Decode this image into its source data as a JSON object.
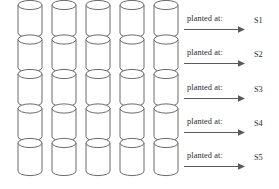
{
  "figure": {
    "type": "schematic-diagram",
    "background_color": "#ffffff",
    "stroke_color": "#5a5a5a",
    "fill_color": "#ffffff",
    "text_color": "#2b2b2b"
  },
  "grid": {
    "columns": 5,
    "rows": 5,
    "total_cylinders": 25,
    "cylinder": {
      "width": 24,
      "body_height": 28,
      "ellipse_ry": 4.6
    },
    "origin_x": 18,
    "origin_y": 5,
    "col_spacing": 34,
    "row_spacing": 34.5
  },
  "rows": [
    {
      "caption": "planted at:",
      "label": "S1",
      "top": 14
    },
    {
      "caption": "planted at:",
      "label": "S2",
      "top": 48
    },
    {
      "caption": "planted at:",
      "label": "S3",
      "top": 83
    },
    {
      "caption": "planted at:",
      "label": "S4",
      "top": 117
    },
    {
      "caption": "planted at:",
      "label": "S5",
      "top": 151
    }
  ],
  "icons": {
    "arrow": "right-arrow-icon",
    "cylinder": "cylinder-icon"
  }
}
